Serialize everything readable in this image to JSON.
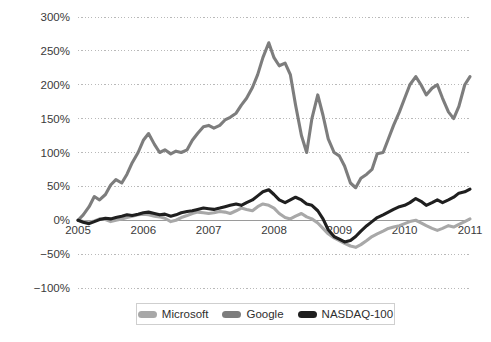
{
  "chart_data": {
    "type": "line",
    "title": "",
    "subtitle": "",
    "xlabel": "",
    "ylabel": "",
    "xlim": [
      2005,
      2011
    ],
    "ylim": [
      -100,
      300
    ],
    "grid": true,
    "legend_position": "bottom-center",
    "y_ticks": [
      300,
      250,
      200,
      150,
      100,
      50,
      0,
      -50,
      -100
    ],
    "y_tick_labels": [
      "300%",
      "250%",
      "200%",
      "150%",
      "100%",
      "50%",
      "0%",
      "−50%",
      "−100%"
    ],
    "x_ticks": [
      2005,
      2006,
      2007,
      2008,
      2009,
      2010,
      2011
    ],
    "x_tick_labels": [
      "2005",
      "2006",
      "2007",
      "2008",
      "2009",
      "2010",
      "2011"
    ],
    "series": [
      {
        "name": "Microsoft",
        "color": "#a8a8a8",
        "x": [
          2005.0,
          2005.08,
          2005.17,
          2005.25,
          2005.33,
          2005.42,
          2005.5,
          2005.58,
          2005.67,
          2005.75,
          2005.83,
          2005.92,
          2006.0,
          2006.08,
          2006.17,
          2006.25,
          2006.33,
          2006.42,
          2006.5,
          2006.58,
          2006.67,
          2006.75,
          2006.83,
          2006.92,
          2007.0,
          2007.08,
          2007.17,
          2007.25,
          2007.33,
          2007.42,
          2007.5,
          2007.58,
          2007.67,
          2007.75,
          2007.83,
          2007.92,
          2008.0,
          2008.08,
          2008.17,
          2008.25,
          2008.33,
          2008.42,
          2008.5,
          2008.58,
          2008.67,
          2008.75,
          2008.83,
          2008.92,
          2009.0,
          2009.08,
          2009.17,
          2009.25,
          2009.33,
          2009.42,
          2009.5,
          2009.58,
          2009.67,
          2009.75,
          2009.83,
          2009.92,
          2010.0,
          2010.08,
          2010.17,
          2010.25,
          2010.33,
          2010.42,
          2010.5,
          2010.58,
          2010.67,
          2010.75,
          2010.83,
          2010.92,
          2011.0
        ],
        "values": [
          0,
          -2,
          -3,
          -1,
          2,
          1,
          -2,
          0,
          2,
          4,
          6,
          8,
          9,
          8,
          6,
          5,
          3,
          -2,
          0,
          4,
          7,
          10,
          12,
          11,
          10,
          11,
          13,
          12,
          10,
          14,
          18,
          16,
          14,
          20,
          24,
          22,
          18,
          10,
          4,
          2,
          6,
          10,
          5,
          2,
          -4,
          -12,
          -20,
          -26,
          -30,
          -34,
          -38,
          -40,
          -36,
          -30,
          -24,
          -20,
          -16,
          -12,
          -10,
          -8,
          -5,
          -2,
          0,
          -4,
          -8,
          -12,
          -15,
          -12,
          -8,
          -10,
          -6,
          -2,
          2
        ]
      },
      {
        "name": "Google",
        "color": "#7d7d7d",
        "x": [
          2005.0,
          2005.08,
          2005.17,
          2005.25,
          2005.33,
          2005.42,
          2005.5,
          2005.58,
          2005.67,
          2005.75,
          2005.83,
          2005.92,
          2006.0,
          2006.08,
          2006.17,
          2006.25,
          2006.33,
          2006.42,
          2006.5,
          2006.58,
          2006.67,
          2006.75,
          2006.83,
          2006.92,
          2007.0,
          2007.08,
          2007.17,
          2007.25,
          2007.33,
          2007.42,
          2007.5,
          2007.58,
          2007.67,
          2007.75,
          2007.83,
          2007.92,
          2008.0,
          2008.08,
          2008.17,
          2008.25,
          2008.33,
          2008.42,
          2008.5,
          2008.58,
          2008.67,
          2008.75,
          2008.83,
          2008.92,
          2009.0,
          2009.08,
          2009.17,
          2009.25,
          2009.33,
          2009.42,
          2009.5,
          2009.58,
          2009.67,
          2009.75,
          2009.83,
          2009.92,
          2010.0,
          2010.08,
          2010.17,
          2010.25,
          2010.33,
          2010.42,
          2010.5,
          2010.58,
          2010.67,
          2010.75,
          2010.83,
          2010.92,
          2011.0
        ],
        "values": [
          0,
          8,
          20,
          35,
          30,
          38,
          52,
          60,
          55,
          68,
          85,
          100,
          118,
          128,
          112,
          100,
          104,
          98,
          102,
          100,
          104,
          118,
          128,
          138,
          140,
          136,
          140,
          148,
          152,
          158,
          170,
          180,
          196,
          215,
          240,
          262,
          240,
          228,
          232,
          215,
          170,
          125,
          100,
          150,
          185,
          155,
          120,
          100,
          95,
          80,
          55,
          48,
          62,
          68,
          75,
          98,
          100,
          120,
          140,
          160,
          180,
          200,
          212,
          200,
          185,
          195,
          200,
          180,
          160,
          150,
          168,
          200,
          212
        ]
      },
      {
        "name": "NASDAQ-100",
        "color": "#1f1f1f",
        "x": [
          2005.0,
          2005.08,
          2005.17,
          2005.25,
          2005.33,
          2005.42,
          2005.5,
          2005.58,
          2005.67,
          2005.75,
          2005.83,
          2005.92,
          2006.0,
          2006.08,
          2006.17,
          2006.25,
          2006.33,
          2006.42,
          2006.5,
          2006.58,
          2006.67,
          2006.75,
          2006.83,
          2006.92,
          2007.0,
          2007.08,
          2007.17,
          2007.25,
          2007.33,
          2007.42,
          2007.5,
          2007.58,
          2007.67,
          2007.75,
          2007.83,
          2007.92,
          2008.0,
          2008.08,
          2008.17,
          2008.25,
          2008.33,
          2008.42,
          2008.5,
          2008.58,
          2008.67,
          2008.75,
          2008.83,
          2008.92,
          2009.0,
          2009.08,
          2009.17,
          2009.25,
          2009.33,
          2009.42,
          2009.5,
          2009.58,
          2009.67,
          2009.75,
          2009.83,
          2009.92,
          2010.0,
          2010.08,
          2010.17,
          2010.25,
          2010.33,
          2010.42,
          2010.5,
          2010.58,
          2010.67,
          2010.75,
          2010.83,
          2010.92,
          2011.0
        ],
        "values": [
          0,
          -3,
          -5,
          -2,
          1,
          3,
          2,
          4,
          6,
          8,
          7,
          9,
          11,
          12,
          10,
          8,
          9,
          6,
          8,
          11,
          13,
          14,
          16,
          18,
          17,
          16,
          18,
          20,
          22,
          24,
          22,
          26,
          30,
          36,
          42,
          45,
          38,
          30,
          26,
          30,
          34,
          30,
          24,
          22,
          14,
          2,
          -14,
          -24,
          -28,
          -32,
          -30,
          -24,
          -16,
          -8,
          -2,
          4,
          8,
          12,
          16,
          20,
          22,
          26,
          32,
          28,
          22,
          26,
          30,
          26,
          30,
          34,
          40,
          42,
          46
        ]
      }
    ]
  },
  "legend": {
    "items": [
      {
        "label": "Microsoft",
        "color": "#a8a8a8"
      },
      {
        "label": "Google",
        "color": "#7d7d7d"
      },
      {
        "label": "NASDAQ-100",
        "color": "#1f1f1f"
      }
    ]
  },
  "colors": {
    "background": "#ffffff",
    "gridline": "#b9b9b9",
    "zero_line": "#9a9a9a",
    "text": "#3a3a3a"
  }
}
